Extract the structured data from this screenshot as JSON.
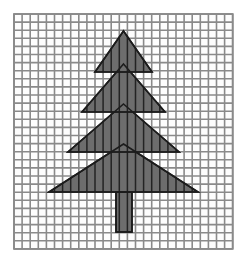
{
  "figure": {
    "canvas": {
      "width": 246,
      "height": 262,
      "background": "#ffffff"
    },
    "grid": {
      "name": "graph-paper-grid",
      "origin_x": 14,
      "origin_y": 14,
      "cell": 8.1,
      "columns": 27,
      "rows": 29,
      "line_color": "#8a8a8a",
      "line_width": 1.6,
      "cell_fill": "#fdfdfd",
      "border_color": "#8a8a8a",
      "border_width": 1.8
    },
    "shape": {
      "name": "christmas-tree",
      "fill": "#6d6d6d",
      "stroke": "#1c1c1c",
      "stroke_width": 1.6,
      "overlay_line_color": "#232323",
      "overlay_line_width": 1.5,
      "tiers": [
        {
          "name": "tier-1-top",
          "apex_x": 123.5,
          "apex_y": 31,
          "base_y": 72,
          "base_left_x": 95,
          "base_right_x": 152
        },
        {
          "name": "tier-2",
          "apex_x": 123.5,
          "apex_y": 64,
          "base_y": 112,
          "base_left_x": 82,
          "base_right_x": 165
        },
        {
          "name": "tier-3",
          "apex_x": 123.5,
          "apex_y": 104,
          "base_y": 152,
          "base_left_x": 68,
          "base_right_x": 179
        },
        {
          "name": "tier-4-bottom",
          "apex_x": 123.5,
          "apex_y": 144,
          "base_y": 192,
          "base_left_x": 49,
          "base_right_x": 198
        }
      ],
      "trunk": {
        "name": "tree-trunk",
        "left_x": 116,
        "right_x": 132,
        "top_y": 192,
        "bottom_y": 232
      }
    }
  },
  "labels": {
    "figure_caption": "",
    "alt_text": "A gray shaded tree made of four stacked triangles and a rectangular trunk drawn on square grid paper"
  }
}
